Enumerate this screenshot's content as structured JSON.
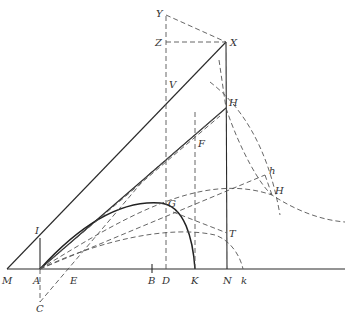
{
  "diagram": {
    "type": "geometric-construction",
    "labels": {
      "M": "M",
      "A": "A",
      "E": "E",
      "B": "B",
      "D": "D",
      "K": "K",
      "N": "N",
      "k": "k",
      "I": "I",
      "C": "C",
      "X": "X",
      "Y": "Y",
      "Z": "Z",
      "V": "V",
      "H": "H",
      "F": "F",
      "G": "G",
      "T": "T",
      "h": "h",
      "H2": "H"
    },
    "points": {
      "M": [
        7,
        269
      ],
      "A": [
        40,
        269
      ],
      "E": [
        72,
        269
      ],
      "B": [
        152,
        269
      ],
      "D": [
        166,
        269
      ],
      "K": [
        195,
        269
      ],
      "N": [
        227,
        269
      ],
      "k": [
        243,
        269
      ],
      "I": [
        40,
        238
      ],
      "C": [
        40,
        302
      ],
      "X": [
        226,
        42
      ],
      "Y": [
        166,
        15
      ],
      "Z": [
        166,
        42
      ],
      "V": [
        166,
        85
      ],
      "H": [
        226,
        108
      ],
      "F": [
        195,
        143
      ],
      "G": [
        173,
        212
      ],
      "T": [
        227,
        233
      ],
      "h": [
        265,
        175
      ],
      "H2": [
        272,
        195
      ]
    },
    "colors": {
      "ink": "#2a2a2a",
      "dashed": "#555555",
      "background": "#ffffff"
    }
  }
}
